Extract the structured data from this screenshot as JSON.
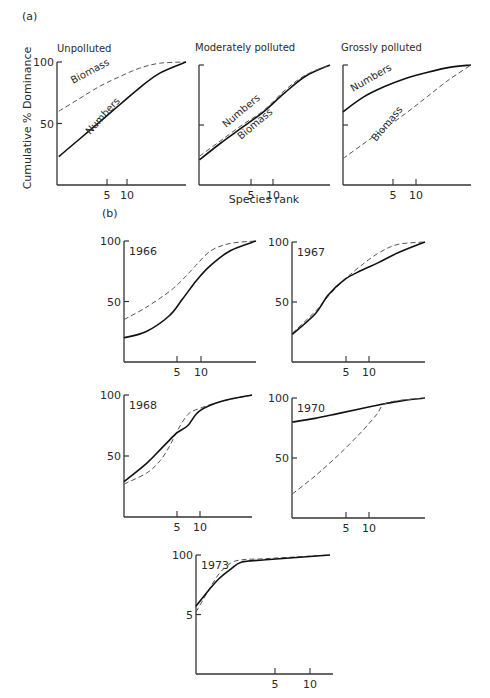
{
  "figure": {
    "part_a_label": "(a)",
    "part_b_label": "(b)",
    "ylabel": "Cumulative % Dominance",
    "xlabel": "Species rank"
  },
  "chart_data": [
    {
      "id": "unpolluted",
      "type": "line",
      "title": "Unpolluted",
      "xscale": "log",
      "xlim": [
        1,
        80
      ],
      "ylim": [
        0,
        100
      ],
      "xticks": [
        5,
        10
      ],
      "yticks": [
        50,
        100
      ],
      "ytick_labels": [
        "50",
        "100"
      ],
      "series": [
        {
          "name": "Biomass",
          "style": "dashed",
          "label": "Biomass",
          "points": [
            [
              1,
              60
            ],
            [
              2,
              70
            ],
            [
              4,
              80
            ],
            [
              8,
              88
            ],
            [
              16,
              95
            ],
            [
              32,
              99
            ],
            [
              80,
              100
            ]
          ]
        },
        {
          "name": "Numbers",
          "style": "solid",
          "label": "Numbers",
          "points": [
            [
              1,
              23
            ],
            [
              2,
              37
            ],
            [
              4,
              51
            ],
            [
              8,
              65
            ],
            [
              16,
              79
            ],
            [
              32,
              91
            ],
            [
              80,
              100
            ]
          ]
        }
      ]
    },
    {
      "id": "moderately-polluted",
      "type": "line",
      "title": "Moderately polluted",
      "xscale": "log",
      "xlim": [
        1,
        80
      ],
      "ylim": [
        0,
        100
      ],
      "xticks": [
        5,
        10
      ],
      "yticks": [
        50,
        100
      ],
      "ytick_labels": [],
      "series": [
        {
          "name": "Numbers",
          "style": "solid",
          "label": "Numbers",
          "points": [
            [
              1,
              21
            ],
            [
              2,
              35
            ],
            [
              4,
              48
            ],
            [
              8,
              61
            ],
            [
              16,
              77
            ],
            [
              32,
              91
            ],
            [
              80,
              100
            ]
          ]
        },
        {
          "name": "Biomass",
          "style": "dashed",
          "label": "Biomass",
          "points": [
            [
              1,
              24
            ],
            [
              2,
              37
            ],
            [
              4,
              50
            ],
            [
              8,
              62
            ],
            [
              16,
              79
            ],
            [
              32,
              92
            ],
            [
              80,
              100
            ]
          ]
        }
      ]
    },
    {
      "id": "grossly-polluted",
      "type": "line",
      "title": "Grossly polluted",
      "xscale": "log",
      "xlim": [
        1,
        80
      ],
      "ylim": [
        0,
        100
      ],
      "xticks": [
        5,
        10
      ],
      "yticks": [
        50,
        100
      ],
      "ytick_labels": [],
      "series": [
        {
          "name": "Numbers",
          "style": "solid",
          "label": "Numbers",
          "points": [
            [
              1,
              61
            ],
            [
              2,
              73
            ],
            [
              4,
              82
            ],
            [
              8,
              89
            ],
            [
              16,
              94
            ],
            [
              32,
              98
            ],
            [
              80,
              100
            ]
          ]
        },
        {
          "name": "Biomass",
          "style": "dashed",
          "label": "Biomass",
          "points": [
            [
              1,
              22
            ],
            [
              2,
              34
            ],
            [
              4,
              47
            ],
            [
              8,
              60
            ],
            [
              16,
              74
            ],
            [
              32,
              88
            ],
            [
              80,
              100
            ]
          ]
        }
      ]
    },
    {
      "id": "1966",
      "type": "line",
      "title": "1966",
      "xscale": "log",
      "xlim": [
        1,
        60
      ],
      "ylim": [
        0,
        100
      ],
      "xticks": [
        5,
        10
      ],
      "yticks": [
        50,
        100
      ],
      "ytick_labels": [
        "50",
        "100"
      ],
      "series": [
        {
          "name": "Biomass",
          "style": "dashed",
          "points": [
            [
              1,
              35
            ],
            [
              2,
              45
            ],
            [
              4,
              58
            ],
            [
              6,
              68
            ],
            [
              9,
              80
            ],
            [
              14,
              92
            ],
            [
              25,
              98
            ],
            [
              60,
              100
            ]
          ]
        },
        {
          "name": "Numbers",
          "style": "solid",
          "points": [
            [
              1,
              20
            ],
            [
              2,
              25
            ],
            [
              4,
              38
            ],
            [
              6,
              52
            ],
            [
              9,
              67
            ],
            [
              14,
              80
            ],
            [
              25,
              92
            ],
            [
              60,
              100
            ]
          ]
        }
      ]
    },
    {
      "id": "1967",
      "type": "line",
      "title": "1967",
      "xscale": "log",
      "xlim": [
        1,
        60
      ],
      "ylim": [
        0,
        100
      ],
      "xticks": [
        5,
        10
      ],
      "yticks": [
        50,
        100
      ],
      "ytick_labels": [
        "50",
        "100"
      ],
      "series": [
        {
          "name": "Biomass",
          "style": "dashed",
          "points": [
            [
              1,
              24
            ],
            [
              2,
              42
            ],
            [
              3,
              55
            ],
            [
              5,
              69
            ],
            [
              8,
              80
            ],
            [
              14,
              91
            ],
            [
              25,
              98
            ],
            [
              60,
              100
            ]
          ]
        },
        {
          "name": "Numbers",
          "style": "solid",
          "points": [
            [
              1,
              23
            ],
            [
              2,
              40
            ],
            [
              3,
              56
            ],
            [
              5,
              69
            ],
            [
              8,
              76
            ],
            [
              14,
              83
            ],
            [
              25,
              91
            ],
            [
              60,
              100
            ]
          ]
        }
      ]
    },
    {
      "id": "1968",
      "type": "line",
      "title": "1968",
      "xscale": "log",
      "xlim": [
        1,
        50
      ],
      "ylim": [
        0,
        100
      ],
      "xticks": [
        5,
        10
      ],
      "yticks": [
        50,
        100
      ],
      "ytick_labels": [
        "50",
        "100"
      ],
      "series": [
        {
          "name": "Biomass",
          "style": "dashed",
          "points": [
            [
              1,
              27
            ],
            [
              2,
              36
            ],
            [
              3,
              46
            ],
            [
              4,
              58
            ],
            [
              5,
              70
            ],
            [
              7,
              84
            ],
            [
              10,
              89
            ],
            [
              20,
              95
            ],
            [
              50,
              100
            ]
          ]
        },
        {
          "name": "Numbers",
          "style": "solid",
          "points": [
            [
              1,
              29
            ],
            [
              2,
              44
            ],
            [
              3,
              55
            ],
            [
              4,
              63
            ],
            [
              5,
              69
            ],
            [
              7,
              75
            ],
            [
              10,
              87
            ],
            [
              20,
              95
            ],
            [
              50,
              100
            ]
          ]
        }
      ]
    },
    {
      "id": "1970",
      "type": "line",
      "title": "1970",
      "xscale": "log",
      "xlim": [
        1,
        60
      ],
      "ylim": [
        0,
        100
      ],
      "xticks": [
        5,
        10
      ],
      "yticks": [
        50,
        100
      ],
      "ytick_labels": [
        "50",
        "100"
      ],
      "series": [
        {
          "name": "Numbers",
          "style": "solid",
          "points": [
            [
              1,
              80
            ],
            [
              2,
              83
            ],
            [
              4,
              87
            ],
            [
              8,
              91
            ],
            [
              16,
              95
            ],
            [
              30,
              98
            ],
            [
              60,
              100
            ]
          ]
        },
        {
          "name": "Biomass",
          "style": "dashed",
          "points": [
            [
              1,
              20
            ],
            [
              2,
              35
            ],
            [
              4,
              52
            ],
            [
              8,
              71
            ],
            [
              13,
              86
            ],
            [
              18,
              96
            ],
            [
              60,
              100
            ]
          ]
        }
      ]
    },
    {
      "id": "1973",
      "type": "line",
      "title": "1973",
      "xscale": "log",
      "xlim": [
        1,
        14
      ],
      "ylim": [
        0,
        100
      ],
      "xticks": [
        5,
        10
      ],
      "yticks": [
        50,
        100
      ],
      "ytick_labels": [
        "5",
        "100"
      ],
      "series": [
        {
          "name": "Biomass",
          "style": "dashed",
          "points": [
            [
              1,
              52
            ],
            [
              1.3,
              70
            ],
            [
              1.6,
              84
            ],
            [
              2,
              93
            ],
            [
              2.5,
              96
            ],
            [
              4,
              97
            ],
            [
              14,
              100
            ]
          ]
        },
        {
          "name": "Numbers",
          "style": "solid",
          "points": [
            [
              1,
              57
            ],
            [
              1.3,
              70
            ],
            [
              1.6,
              80
            ],
            [
              2,
              88
            ],
            [
              2.5,
              94
            ],
            [
              4,
              96
            ],
            [
              14,
              100
            ]
          ]
        }
      ]
    }
  ]
}
